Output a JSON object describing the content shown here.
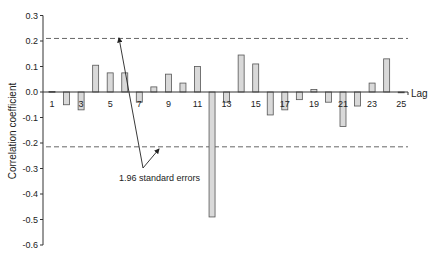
{
  "chart_data": {
    "type": "bar",
    "title": "",
    "xlabel": "Lag",
    "ylabel": "Correlation coefficient",
    "ylim": [
      -0.6,
      0.3
    ],
    "yticks": [
      "0.3",
      "0.2",
      "0.1",
      "0.0",
      "-0.1",
      "-0.2",
      "-0.3",
      "-0.4",
      "-0.5",
      "-0.6"
    ],
    "xtick_labels": [
      "1",
      "3",
      "5",
      "7",
      "9",
      "11",
      "13",
      "15",
      "17",
      "19",
      "21",
      "23",
      "25"
    ],
    "categories": [
      1,
      2,
      3,
      4,
      5,
      6,
      7,
      8,
      9,
      10,
      11,
      12,
      13,
      14,
      15,
      16,
      17,
      18,
      19,
      20,
      21,
      22,
      23,
      24,
      25
    ],
    "values": [
      0.002,
      -0.05,
      -0.07,
      0.105,
      0.075,
      0.075,
      -0.04,
      0.02,
      0.07,
      0.035,
      0.1,
      -0.49,
      -0.04,
      0.145,
      0.11,
      -0.09,
      -0.07,
      -0.03,
      0.01,
      -0.04,
      -0.135,
      -0.055,
      0.035,
      0.13,
      -0.003
    ],
    "confidence_bounds": {
      "upper": 0.21,
      "lower": -0.215,
      "style": "dashed"
    },
    "annotation": "1.96 standard errors",
    "grid": false,
    "legend": null,
    "bar_color": "#d9d9d9",
    "bar_edge_color": "#555555",
    "dashed_line_color": "#666666"
  }
}
